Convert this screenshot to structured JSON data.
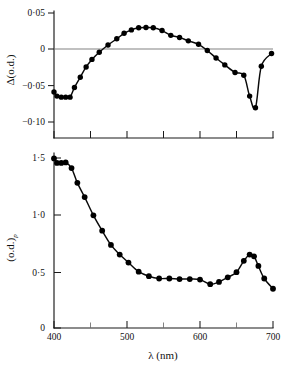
{
  "figure": {
    "background_color": "#ffffff",
    "ink_color": "#000000",
    "panel_count": 2
  },
  "chart_data": [
    {
      "id": "panel-top-difference-spectrum",
      "type": "line",
      "title": "",
      "subtitle": "",
      "xlabel": "",
      "ylabel": "Δ(o.d.)",
      "xlim": [
        400,
        700
      ],
      "ylim": [
        -0.125,
        0.06
      ],
      "grid": false,
      "legend": null,
      "x_tick_values": [
        400,
        450,
        500,
        550,
        600,
        650,
        700
      ],
      "x_tick_labels": [
        "",
        "",
        "",
        "",
        "",
        "",
        ""
      ],
      "y_tick_values": [
        0.05,
        0,
        -0.05,
        -0.1
      ],
      "y_tick_labels": [
        "0·05",
        "0",
        "−0·05",
        "−0·10"
      ],
      "zero_reference_line": 0,
      "markers": "filled-circle",
      "x": [
        400,
        404,
        410,
        416,
        422,
        428,
        436,
        444,
        452,
        462,
        474,
        486,
        496,
        506,
        516,
        526,
        536,
        548,
        560,
        572,
        584,
        598,
        610,
        622,
        634,
        648,
        660,
        668,
        676,
        684,
        698
      ],
      "values": [
        -0.058,
        -0.064,
        -0.0655,
        -0.0655,
        -0.0655,
        -0.0515,
        -0.0365,
        -0.0215,
        -0.0105,
        0.0,
        0.0105,
        0.0195,
        0.0275,
        0.0325,
        0.0355,
        0.036,
        0.0355,
        0.0315,
        0.0245,
        0.0215,
        0.0165,
        0.0115,
        0.0025,
        -0.0085,
        -0.0185,
        -0.0295,
        -0.0335,
        -0.064,
        -0.081,
        -0.0205,
        -0.002
      ]
    },
    {
      "id": "panel-bottom-absorption-spectrum",
      "type": "line",
      "title": "",
      "subtitle": "",
      "xlabel": "λ (nm)",
      "ylabel": "(o.d.)",
      "ylabel_subscript": "р",
      "xlim": [
        400,
        700
      ],
      "ylim": [
        0,
        1.62
      ],
      "grid": false,
      "legend": null,
      "x_tick_values": [
        400,
        450,
        500,
        550,
        600,
        650,
        700
      ],
      "x_tick_labels": [
        "400",
        "",
        "500",
        "",
        "600",
        "",
        "700"
      ],
      "y_tick_values": [
        1.5,
        1.0,
        0.5,
        0
      ],
      "y_tick_labels": [
        "1·5",
        "1·0",
        "0·5",
        "0"
      ],
      "markers": "filled-circle",
      "x": [
        400,
        404,
        410,
        416,
        424,
        432,
        442,
        454,
        466,
        478,
        490,
        502,
        516,
        530,
        544,
        558,
        572,
        586,
        600,
        614,
        626,
        638,
        650,
        660,
        668,
        674,
        680,
        688,
        700
      ],
      "values": [
        1.49,
        1.45,
        1.45,
        1.455,
        1.405,
        1.275,
        1.15,
        0.99,
        0.855,
        0.73,
        0.645,
        0.575,
        0.495,
        0.455,
        0.435,
        0.435,
        0.43,
        0.43,
        0.425,
        0.385,
        0.405,
        0.445,
        0.49,
        0.59,
        0.645,
        0.63,
        0.545,
        0.435,
        0.345
      ]
    }
  ]
}
